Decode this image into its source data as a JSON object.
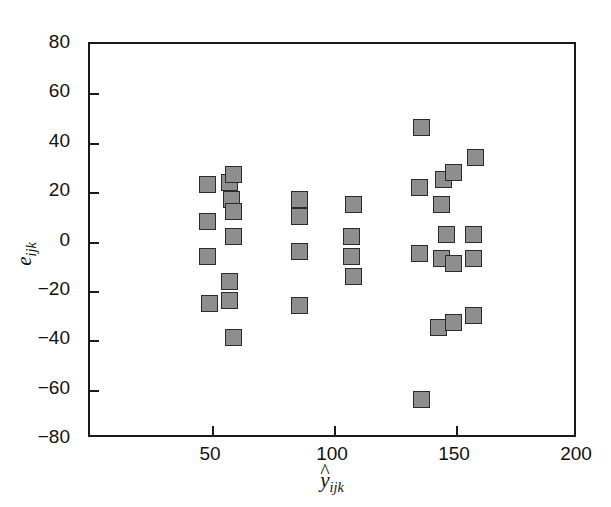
{
  "chart_data": {
    "type": "scatter",
    "title": "",
    "xlabel": "ŷ_ijk",
    "ylabel": "e_ijk",
    "xlabel_base": "y",
    "xlabel_sub": "ijk",
    "ylabel_base": "e",
    "ylabel_sub": "ijk",
    "xlim": [
      0,
      200
    ],
    "ylim": [
      -80,
      80
    ],
    "xticks": [
      50,
      100,
      150,
      200
    ],
    "yticks": [
      80,
      60,
      40,
      20,
      0,
      -20,
      -40,
      -60,
      -80
    ],
    "xtick_labels": [
      "50",
      "100",
      "150",
      "200"
    ],
    "ytick_labels": [
      "80",
      "60",
      "40",
      "20",
      "0",
      "−20",
      "−40",
      "−60",
      "−80"
    ],
    "grid": false,
    "legend": null,
    "marker": "square",
    "marker_face_color": "#8e8e8e",
    "marker_edge_color": "#2b2b2b",
    "frame_color": "#1a1a1a",
    "background_color": "#ffffff",
    "points": [
      {
        "x": 48,
        "y": 23
      },
      {
        "x": 48,
        "y": 8
      },
      {
        "x": 48,
        "y": -6
      },
      {
        "x": 49,
        "y": -25
      },
      {
        "x": 57,
        "y": 24
      },
      {
        "x": 59,
        "y": 27
      },
      {
        "x": 58,
        "y": 17
      },
      {
        "x": 59,
        "y": 12
      },
      {
        "x": 59,
        "y": 2
      },
      {
        "x": 57,
        "y": -16
      },
      {
        "x": 57,
        "y": -24
      },
      {
        "x": 59,
        "y": -39
      },
      {
        "x": 86,
        "y": 17
      },
      {
        "x": 86,
        "y": 10
      },
      {
        "x": 86,
        "y": -4
      },
      {
        "x": 86,
        "y": -26
      },
      {
        "x": 108,
        "y": 15
      },
      {
        "x": 107,
        "y": 2
      },
      {
        "x": 107,
        "y": -6
      },
      {
        "x": 108,
        "y": -14
      },
      {
        "x": 136,
        "y": 46
      },
      {
        "x": 135,
        "y": 22
      },
      {
        "x": 135,
        "y": -5
      },
      {
        "x": 136,
        "y": -64
      },
      {
        "x": 145,
        "y": 25
      },
      {
        "x": 144,
        "y": 15
      },
      {
        "x": 146,
        "y": 3
      },
      {
        "x": 144,
        "y": -7
      },
      {
        "x": 143,
        "y": -35
      },
      {
        "x": 149,
        "y": 28
      },
      {
        "x": 149,
        "y": -9
      },
      {
        "x": 149,
        "y": -33
      },
      {
        "x": 158,
        "y": 34
      },
      {
        "x": 157,
        "y": 3
      },
      {
        "x": 157,
        "y": -7
      },
      {
        "x": 157,
        "y": -30
      }
    ]
  }
}
